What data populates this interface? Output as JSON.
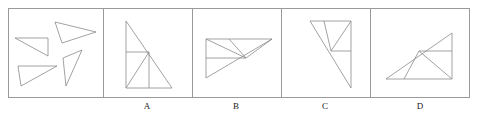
{
  "figure": {
    "type": "geometry-multiple-choice-figure",
    "stroke_color": "#8a8a8a",
    "frame_color": "#9a9a9a",
    "label_color": "#1a1a1a",
    "background_color": "#ffffff",
    "frame": {
      "x": 8,
      "y": 8,
      "width": 462,
      "height": 90
    },
    "dividers_x": [
      103,
      192,
      281,
      370
    ]
  },
  "panels": [
    {
      "id": "stimulus",
      "label": "",
      "box": {
        "x": 8,
        "y": 8,
        "width": 95,
        "height": 90
      },
      "shapes": [
        {
          "name": "triangle-top-right",
          "points": "55,22 96,32 62,43"
        },
        {
          "name": "triangle-left-upper",
          "points": "15,38 48,38 48,56"
        },
        {
          "name": "triangle-left-lower",
          "points": "18,66 57,66 21,86"
        },
        {
          "name": "triangle-right-lower",
          "points": "63,58 82,50 66,86"
        }
      ]
    },
    {
      "id": "choice-a",
      "label": "A",
      "box": {
        "x": 103,
        "y": 8,
        "width": 89,
        "height": 90
      },
      "shapes": [
        {
          "name": "outer-right-triangle",
          "points": "126,21 126,88 172,88"
        },
        {
          "name": "hypotenuse",
          "points": "126,21 172,88"
        },
        {
          "name": "horizontal-mid",
          "points": "126,52 149,52"
        },
        {
          "name": "vertical-inner",
          "points": "149,52 149,88"
        },
        {
          "name": "diagonal-inner",
          "points": "149,52 126,88"
        }
      ]
    },
    {
      "id": "choice-b",
      "label": "B",
      "box": {
        "x": 192,
        "y": 8,
        "width": 89,
        "height": 90
      },
      "shapes": [
        {
          "name": "outer-triangle",
          "points": "206,39 272,39 206,78"
        },
        {
          "name": "hypotenuse",
          "points": "272,39 206,78"
        },
        {
          "name": "horizontal-mid",
          "points": "206,58 246,58"
        },
        {
          "name": "spoke-upper-left",
          "points": "246,58 206,39"
        },
        {
          "name": "spoke-upper-mid",
          "points": "246,58 229,39"
        },
        {
          "name": "spoke-right",
          "points": "246,58 272,39"
        }
      ]
    },
    {
      "id": "choice-c",
      "label": "C",
      "box": {
        "x": 281,
        "y": 8,
        "width": 89,
        "height": 90
      },
      "shapes": [
        {
          "name": "outer-inverted-triangle",
          "points": "310,21 351,21 331,51"
        },
        {
          "name": "long-diagonal",
          "points": "310,21 351,88"
        },
        {
          "name": "right-edge",
          "points": "351,21 351,88"
        },
        {
          "name": "spoke-mid",
          "points": "331,51 324,21"
        },
        {
          "name": "spoke-upper-right",
          "points": "331,51 351,21"
        },
        {
          "name": "horizontal-right",
          "points": "331,51 351,51"
        }
      ]
    },
    {
      "id": "choice-d",
      "label": "D",
      "box": {
        "x": 370,
        "y": 8,
        "width": 100,
        "height": 90
      },
      "shapes": [
        {
          "name": "outer-triangle",
          "points": "386,79 452,79 452,33"
        },
        {
          "name": "hypotenuse",
          "points": "386,79 452,33"
        },
        {
          "name": "horizontal-mid",
          "points": "419,51 452,51"
        },
        {
          "name": "spoke-down-left",
          "points": "419,51 404,79"
        },
        {
          "name": "spoke-down-right",
          "points": "419,51 452,79"
        }
      ]
    }
  ],
  "labels": {
    "a": "A",
    "b": "B",
    "c": "C",
    "d": "D"
  }
}
